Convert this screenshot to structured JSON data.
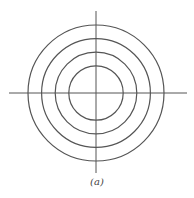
{
  "figure": {
    "caption": "(a)",
    "stroke_color": "#555555",
    "circle_count": 4,
    "relative_radii": [
      0.4,
      0.6,
      0.8,
      1.0
    ],
    "axes": [
      "horizontal",
      "vertical"
    ]
  }
}
